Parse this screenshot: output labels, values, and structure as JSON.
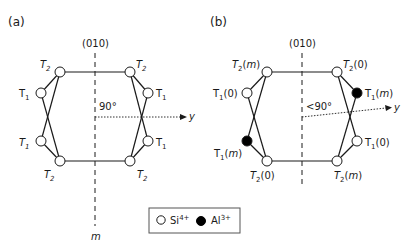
{
  "panels": [
    {
      "id": "a",
      "label": "(a)",
      "plane_label": "(010)",
      "mirror_label": "m",
      "angle_label": "90°",
      "axis_label": "y",
      "sites": [
        {
          "name": "T2",
          "sub": "2",
          "suffix": "",
          "position": "top-left",
          "occupant": "Si4+"
        },
        {
          "name": "T2",
          "sub": "2",
          "suffix": "",
          "position": "top-right",
          "occupant": "Si4+"
        },
        {
          "name": "T1",
          "sub": "1",
          "suffix": "",
          "position": "upper-left",
          "occupant": "Si4+"
        },
        {
          "name": "T1",
          "sub": "1",
          "suffix": "",
          "position": "upper-right",
          "occupant": "Si4+"
        },
        {
          "name": "T1",
          "sub": "1",
          "suffix": "",
          "position": "lower-left",
          "occupant": "Si4+"
        },
        {
          "name": "T1",
          "sub": "1",
          "suffix": "",
          "position": "lower-right",
          "occupant": "Si4+"
        },
        {
          "name": "T2",
          "sub": "2",
          "suffix": "",
          "position": "bottom-left",
          "occupant": "Si4+"
        },
        {
          "name": "T2",
          "sub": "2",
          "suffix": "",
          "position": "bottom-right",
          "occupant": "Si4+"
        }
      ]
    },
    {
      "id": "b",
      "label": "(b)",
      "plane_label": "(010)",
      "angle_label": "<90°",
      "axis_label": "y",
      "sites": [
        {
          "name": "T2(m)",
          "sub": "2",
          "suffix": "m",
          "position": "top-left",
          "occupant": "Si4+"
        },
        {
          "name": "T2(0)",
          "sub": "2",
          "suffix": "0",
          "position": "top-right",
          "occupant": "Si4+"
        },
        {
          "name": "T1(0)",
          "sub": "1",
          "suffix": "0",
          "position": "upper-left",
          "occupant": "Si4+"
        },
        {
          "name": "T1(m)",
          "sub": "1",
          "suffix": "m",
          "position": "upper-right",
          "occupant": "Al3+"
        },
        {
          "name": "T1(m)",
          "sub": "1",
          "suffix": "m",
          "position": "lower-left",
          "occupant": "Al3+"
        },
        {
          "name": "T1(0)",
          "sub": "1",
          "suffix": "0",
          "position": "lower-right",
          "occupant": "Si4+"
        },
        {
          "name": "T2(0)",
          "sub": "2",
          "suffix": "0",
          "position": "bottom-left",
          "occupant": "Si4+"
        },
        {
          "name": "T2(m)",
          "sub": "2",
          "suffix": "m",
          "position": "bottom-right",
          "occupant": "Si4+"
        }
      ]
    }
  ],
  "legend": {
    "items": [
      {
        "symbol": "open-circle",
        "base": "Si",
        "charge": "4+"
      },
      {
        "symbol": "filled-circle",
        "base": "Al",
        "charge": "3+"
      }
    ]
  },
  "text": {
    "T": "T",
    "sub1": "1",
    "sub2": "2",
    "paren_open": "(",
    "paren_close": ")",
    "m": "m",
    "zero": "0"
  },
  "colors": {
    "line": "#1a1a1a",
    "si_fill": "#ffffff",
    "al_fill": "#000000"
  }
}
